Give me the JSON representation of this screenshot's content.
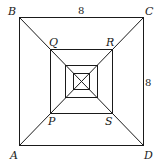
{
  "diagram": {
    "type": "nested squares with diagonals",
    "outer_square": {
      "labels": {
        "top_left": "B",
        "top_right": "C",
        "bottom_left": "A",
        "bottom_right": "D"
      }
    },
    "second_square": {
      "labels": {
        "top_left": "Q",
        "top_right": "R",
        "bottom_left": "P",
        "bottom_right": "S"
      }
    },
    "side_labels": {
      "top": "8",
      "right": "8"
    },
    "nested_square_count": 4,
    "diagonals": [
      "B-D",
      "A-C"
    ]
  }
}
